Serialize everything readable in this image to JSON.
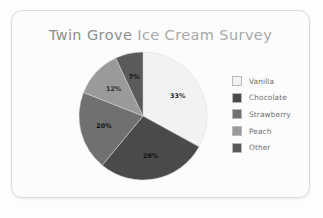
{
  "card": {
    "background": "#fcfcfc",
    "border_color": "#dcdcdc"
  },
  "chart_title": {
    "full": "Twin Grove Ice Cream Survey",
    "emphasis": "Twin Grove",
    "rest": " Ice Cream Survey"
  },
  "legend": {
    "position": "right",
    "items": [
      {
        "label": "Vanilla",
        "color": "#f2f2f2",
        "value_label": "33%"
      },
      {
        "label": "Chocolate",
        "color": "#4a4a4a",
        "value_label": "28%"
      },
      {
        "label": "Strawberry",
        "color": "#707070",
        "value_label": "20%"
      },
      {
        "label": "Peach",
        "color": "#9a9a9a",
        "value_label": "12%"
      },
      {
        "label": "Other",
        "color": "#5a5a5a",
        "value_label": "7%"
      }
    ]
  },
  "chart_data": {
    "type": "pie",
    "title": "Twin Grove Ice Cream Survey",
    "xlabel": "",
    "ylabel": "",
    "units": "percent",
    "categories": [
      "Vanilla",
      "Chocolate",
      "Strawberry",
      "Peach",
      "Other"
    ],
    "values": [
      33,
      28,
      20,
      12,
      7
    ],
    "data_labels": [
      "33%",
      "28%",
      "20%",
      "12%",
      "7%"
    ],
    "colors": [
      "#f2f2f2",
      "#4a4a4a",
      "#707070",
      "#9a9a9a",
      "#5a5a5a"
    ],
    "start_angle_deg": 0,
    "direction": "clockwise",
    "legend": true,
    "legend_position": "right",
    "grid": false,
    "slices": [
      {
        "category": "Vanilla",
        "value": 33,
        "label": "33%",
        "color": "#f2f2f2",
        "label_x": 83,
        "label_y": 58
      },
      {
        "category": "Chocolate",
        "value": 28,
        "label": "28%",
        "color": "#4a4a4a",
        "label_x": 76,
        "label_y": 110
      },
      {
        "category": "Strawberry",
        "value": 20,
        "label": "20%",
        "color": "#707070",
        "label_x": 40,
        "label_y": 89
      },
      {
        "category": "Peach",
        "value": 12,
        "label": "12%",
        "color": "#9a9a9a",
        "label_x": 43,
        "label_y": 48
      },
      {
        "category": "Other",
        "value": 7,
        "label": "7%",
        "color": "#5a5a5a",
        "label_x": 63,
        "label_y": 30
      }
    ]
  }
}
